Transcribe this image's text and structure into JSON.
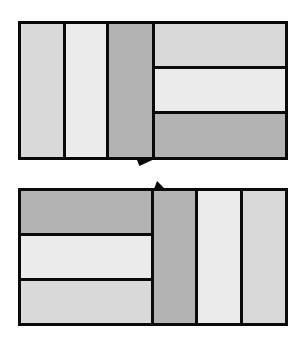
{
  "title": "",
  "colors": {
    "border": "#0a0a0a",
    "light": "#d9d9d9",
    "lighter": "#ebebeb",
    "dark": "#b3b3b3"
  },
  "diagram": {
    "top_panel": {
      "vertical_strips": [
        "light",
        "lighter",
        "dark"
      ],
      "horizontal_strips": [
        "light",
        "lighter",
        "dark"
      ]
    },
    "bottom_panel": {
      "horizontal_strips": [
        "dark",
        "lighter",
        "light"
      ],
      "vertical_strips": [
        "dark",
        "lighter",
        "light"
      ]
    },
    "connector": "hinge notch between panels"
  }
}
